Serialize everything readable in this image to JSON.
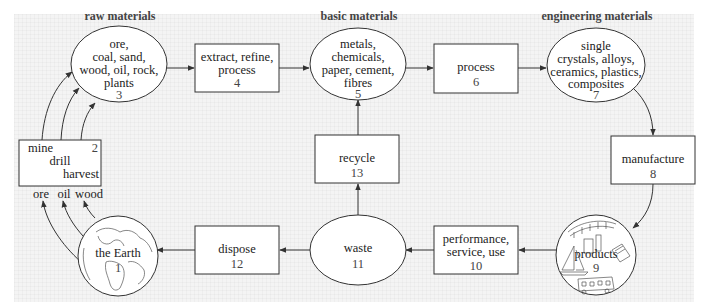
{
  "headers": {
    "raw": "raw materials",
    "basic": "basic materials",
    "engineering": "engineering materials"
  },
  "nodes": {
    "earth": {
      "lines": [
        "the Earth"
      ],
      "num": "1"
    },
    "mine": {
      "lines": [
        "mine",
        "drill",
        "harvest"
      ],
      "num": "2"
    },
    "raw": {
      "lines": [
        "ore,",
        "coal, sand,",
        "wood, oil, rock,",
        "plants"
      ],
      "num": "3"
    },
    "extract": {
      "lines": [
        "extract, refine,",
        "process"
      ],
      "num": "4"
    },
    "basic": {
      "lines": [
        "metals,",
        "chemicals,",
        "paper, cement,",
        "fibres"
      ],
      "num": "5"
    },
    "process": {
      "lines": [
        "process"
      ],
      "num": "6"
    },
    "engineering": {
      "lines": [
        "single",
        "crystals, alloys,",
        "ceramics, plastics,",
        "composites"
      ],
      "num": "7"
    },
    "manufacture": {
      "lines": [
        "manufacture"
      ],
      "num": "8"
    },
    "products": {
      "lines": [
        "products"
      ],
      "num": "9"
    },
    "performance": {
      "lines": [
        "performance,",
        "service, use"
      ],
      "num": "10"
    },
    "waste": {
      "lines": [
        "waste"
      ],
      "num": "11"
    },
    "dispose": {
      "lines": [
        "dispose"
      ],
      "num": "12"
    },
    "recycle": {
      "lines": [
        "recycle"
      ],
      "num": "13"
    }
  },
  "extraction_labels": [
    "ore",
    "oil",
    "wood"
  ],
  "colors": {
    "background": "#f4f4f4",
    "stroke": "#333333",
    "text": "#222222"
  }
}
